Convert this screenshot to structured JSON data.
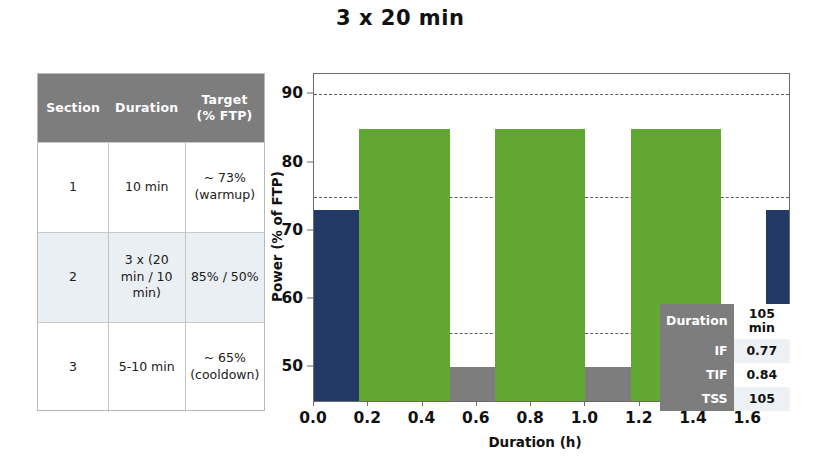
{
  "title": "3 x 20 min",
  "table": {
    "headers": [
      "Section",
      "Duration",
      "Target\n(% FTP)"
    ],
    "header_section": "Section",
    "header_duration": "Duration",
    "header_target_line1": "Target",
    "header_target_line2": "(% FTP)",
    "rows": [
      {
        "section": "1",
        "duration": "10 min",
        "target_line1": "~ 73%",
        "target_line2": "(warmup)"
      },
      {
        "section": "2",
        "duration_line1": "3 x (20",
        "duration_line2": "min / 10",
        "duration_line3": "min)",
        "target_line1": "85% / 50%",
        "target_line2": ""
      },
      {
        "section": "3",
        "duration": "5-10 min",
        "target_line1": "~ 65%",
        "target_line2": "(cooldown)"
      }
    ]
  },
  "stats": {
    "rows": [
      {
        "key": "Duration",
        "value": "105 min"
      },
      {
        "key": "IF",
        "value": "0.77"
      },
      {
        "key": "TIF",
        "value": "0.84"
      },
      {
        "key": "TSS",
        "value": "105"
      }
    ]
  },
  "colors": {
    "warmup_cooldown": "#233a66",
    "interval": "#62a731",
    "recovery": "#7d7d7d",
    "gridline": "#5d5d5d",
    "axis": "#6b6b6b",
    "table_header": "#7d7d7d",
    "table_row_alt": "#eaeff3"
  },
  "chart_data": {
    "type": "bar",
    "title": "3 x 20 min",
    "xlabel": "Duration (h)",
    "ylabel": "Power (% of FTP)",
    "xlim": [
      0.0,
      1.75
    ],
    "ylim": [
      45.0,
      93.0
    ],
    "xticks": [
      0.0,
      0.2,
      0.4,
      0.6,
      0.8,
      1.0,
      1.2,
      1.4,
      1.6
    ],
    "xtick_labels": [
      "0.0",
      "0.2",
      "0.4",
      "0.6",
      "0.8",
      "1.0",
      "1.2",
      "1.4",
      "1.6"
    ],
    "yticks": [
      50,
      60,
      70,
      80,
      90
    ],
    "ytick_labels": [
      "50",
      "60",
      "70",
      "80",
      "90"
    ],
    "grid": true,
    "gridlines_y": [
      55,
      75,
      90
    ],
    "legend": "none",
    "bars": [
      {
        "label": "warmup",
        "x_start": 0.0,
        "x_end": 0.1667,
        "value": 73,
        "color": "#233a66"
      },
      {
        "label": "interval1",
        "x_start": 0.1667,
        "x_end": 0.5,
        "value": 85,
        "color": "#62a731"
      },
      {
        "label": "recovery1",
        "x_start": 0.5,
        "x_end": 0.6667,
        "value": 50,
        "color": "#7d7d7d"
      },
      {
        "label": "interval2",
        "x_start": 0.6667,
        "x_end": 1.0,
        "value": 85,
        "color": "#62a731"
      },
      {
        "label": "recovery2",
        "x_start": 1.0,
        "x_end": 1.1667,
        "value": 50,
        "color": "#7d7d7d"
      },
      {
        "label": "interval3",
        "x_start": 1.1667,
        "x_end": 1.5,
        "value": 85,
        "color": "#62a731"
      },
      {
        "label": "cooldown",
        "x_start": 1.6667,
        "x_end": 1.75,
        "value": 73,
        "color": "#233a66"
      }
    ]
  }
}
